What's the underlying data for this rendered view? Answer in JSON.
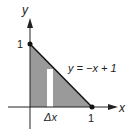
{
  "diagram": {
    "axes": {
      "x_label": "x",
      "y_label": "y"
    },
    "tick_labels": {
      "x_one": "1",
      "y_one": "1"
    },
    "line_label": "y = −x + 1",
    "strip_label": "Δx",
    "colors": {
      "shaded_region": "#9a9a9a",
      "strip": "#ffffff",
      "line": "#111111",
      "axes": "#222222"
    }
  }
}
